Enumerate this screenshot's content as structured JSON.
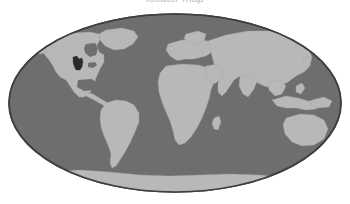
{
  "figure": {
    "kind": "locator-map",
    "projection": "Mollweide",
    "background_color": "#ffffff",
    "caption_clipped_text": "locator map"
  },
  "map": {
    "title": "World locator map",
    "ocean_label": "Ocean",
    "land_label": "Land",
    "highlight_label": "Highlighted region",
    "graticule_label": "Graticule",
    "colors": {
      "ocean": "#6e6e6e",
      "ocean_outline": "#3f3f3f",
      "land": "#b8b8b8",
      "land_outline": "#9a9a9a",
      "highlight": "#2b2b2b",
      "background": "#ffffff"
    },
    "ellipse": {
      "center_x": 175,
      "center_y": 103,
      "radius_x": 166,
      "radius_y": 89,
      "outline_width": 1.6
    },
    "landmasses": [
      {
        "name": "north-america",
        "label": "North America"
      },
      {
        "name": "greenland",
        "label": "Greenland"
      },
      {
        "name": "south-america",
        "label": "South America"
      },
      {
        "name": "europe",
        "label": "Europe"
      },
      {
        "name": "africa",
        "label": "Africa"
      },
      {
        "name": "asia",
        "label": "Asia"
      },
      {
        "name": "australia",
        "label": "Australia"
      },
      {
        "name": "antarctica",
        "label": "Antarctica"
      },
      {
        "name": "maritime-southeast-asia",
        "label": "Maritime Southeast Asia"
      },
      {
        "name": "madagascar",
        "label": "Madagascar"
      },
      {
        "name": "new-zealand",
        "label": "New Zealand"
      },
      {
        "name": "japan",
        "label": "Japan"
      },
      {
        "name": "british-isles",
        "label": "British Isles"
      }
    ],
    "highlight": {
      "name": "highlighted-region",
      "label": "Highlighted region",
      "continent": "North America",
      "approx_center_x": 78,
      "approx_center_y": 63
    }
  }
}
